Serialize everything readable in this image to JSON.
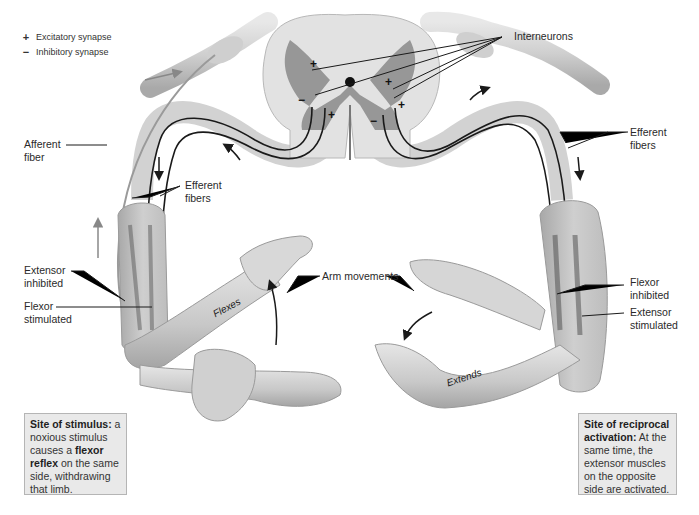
{
  "figure": {
    "topic": "Crossed-extensor reflex",
    "legend": [
      {
        "symbol": "+",
        "label": "Excitatory synapse"
      },
      {
        "symbol": "−",
        "label": "Inhibitory synapse"
      }
    ],
    "spinal_cord_synapse_signs": [
      "+",
      "−",
      "+",
      "−",
      "+",
      "+"
    ],
    "labels": {
      "interneurons": "Interneurons",
      "afferent_fiber": [
        "Afferent",
        "fiber"
      ],
      "efferent_fibers_left": [
        "Efferent",
        "fibers"
      ],
      "efferent_fibers_right": [
        "Efferent",
        "fibers"
      ],
      "extensor_inhibited": [
        "Extensor",
        "inhibited"
      ],
      "flexor_stimulated": [
        "Flexor",
        "stimulated"
      ],
      "flexor_inhibited": [
        "Flexor",
        "inhibited"
      ],
      "extensor_stimulated": [
        "Extensor",
        "stimulated"
      ],
      "arm_movements": "Arm movements",
      "flexes": "Flexes",
      "extends": "Extends"
    },
    "boxes": {
      "left": {
        "title": "Site of stimulus:",
        "text_1": "a noxious stimulus causes a ",
        "bold": "flexor reflex",
        "text_2": " on the same side, withdrawing that limb."
      },
      "right": {
        "title": "Site of reciprocal activation:",
        "text": " At the same time, the extensor muscles on the opposite side are activated."
      }
    },
    "colors": {
      "background": "#ffffff",
      "box_fill": "#e9e9e9",
      "box_border": "#b5b5b5",
      "nerve": "#d4d4d4",
      "gray_matter": "#8a8a8a",
      "white_matter": "#e2e2e2",
      "skin": "#cfcfcf",
      "fiber": "#1a1a1a"
    }
  }
}
